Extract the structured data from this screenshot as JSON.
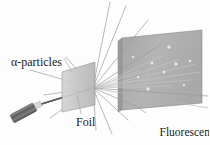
{
  "figure": {
    "background_color": "#fdfdfd"
  },
  "labels": {
    "alpha_particles": "α-particles",
    "foil": "Foil",
    "screen_line1": "Fluorescent",
    "screen_line2": "screen"
  },
  "colors": {
    "foil_fill": "#c8c8c8",
    "foil_edge": "#8f8f8f",
    "screen_fill": "#b0b0b0",
    "screen_edge": "#8a8a8a",
    "screen_side_fill": "#9a9a9a",
    "source_body": "#6e6e6e",
    "source_tip": "#d8d8d8",
    "ray": "#9b9b9b",
    "beam": "#4a4a4a",
    "flash": "#f2f2f2",
    "label_text": "#1a1a1a",
    "leader": "#a8a8a8"
  },
  "geometry": {
    "scatter_point": {
      "x": 93,
      "y": 88
    },
    "foil_quad": "62,72 95,62 95,105 62,112",
    "screen_quad": "122,38 202,30 202,103 122,110",
    "screen_side_quad": "118,41 122,38 122,110 118,112",
    "source": {
      "x1": 12,
      "y1": 119,
      "x2": 40,
      "y2": 104,
      "width": 9
    }
  },
  "rays": [
    {
      "name": "incident-beam",
      "x1": 38,
      "y1": 105,
      "x2": 93,
      "y2": 88,
      "w": 1.4,
      "color": "#4a4a4a"
    },
    {
      "name": "incident-beam-2",
      "x1": 30,
      "y1": 108,
      "x2": 93,
      "y2": 88,
      "w": 1.0,
      "color": "#5a5a5a"
    },
    {
      "name": "backscatter-left-1",
      "x1": 93,
      "y1": 88,
      "x2": 30,
      "y2": 70,
      "w": 0.7,
      "color": "#9b9b9b"
    },
    {
      "name": "backscatter-left-2",
      "x1": 93,
      "y1": 88,
      "x2": 44,
      "y2": 95,
      "w": 0.7,
      "color": "#9b9b9b"
    },
    {
      "name": "backscatter-left-3",
      "x1": 93,
      "y1": 88,
      "x2": 50,
      "y2": 118,
      "w": 0.7,
      "color": "#9b9b9b"
    },
    {
      "name": "backscatter-left-4",
      "x1": 93,
      "y1": 88,
      "x2": 66,
      "y2": 57,
      "w": 0.7,
      "color": "#9b9b9b"
    },
    {
      "name": "scatter-up-1",
      "x1": 93,
      "y1": 88,
      "x2": 110,
      "y2": 2,
      "w": 0.7,
      "color": "#9b9b9b"
    },
    {
      "name": "scatter-up-2",
      "x1": 93,
      "y1": 88,
      "x2": 126,
      "y2": 6,
      "w": 0.7,
      "color": "#9b9b9b"
    },
    {
      "name": "scatter-up-3",
      "x1": 93,
      "y1": 88,
      "x2": 148,
      "y2": 20,
      "w": 0.7,
      "color": "#9b9b9b"
    },
    {
      "name": "scatter-up-4",
      "x1": 93,
      "y1": 88,
      "x2": 160,
      "y2": 45,
      "w": 0.7,
      "color": "#9b9b9b"
    },
    {
      "name": "scatter-screen-1",
      "x1": 93,
      "y1": 88,
      "x2": 162,
      "y2": 56,
      "w": 0.7,
      "color": "#c4c4c4"
    },
    {
      "name": "scatter-screen-2",
      "x1": 93,
      "y1": 88,
      "x2": 178,
      "y2": 60,
      "w": 0.7,
      "color": "#c4c4c4"
    },
    {
      "name": "scatter-screen-3",
      "x1": 93,
      "y1": 88,
      "x2": 196,
      "y2": 64,
      "w": 0.7,
      "color": "#c4c4c4"
    },
    {
      "name": "scatter-screen-4",
      "x1": 93,
      "y1": 88,
      "x2": 200,
      "y2": 72,
      "w": 0.7,
      "color": "#c4c4c4"
    },
    {
      "name": "scatter-screen-5",
      "x1": 93,
      "y1": 88,
      "x2": 190,
      "y2": 80,
      "w": 0.7,
      "color": "#c4c4c4"
    },
    {
      "name": "scatter-screen-6",
      "x1": 93,
      "y1": 88,
      "x2": 170,
      "y2": 86,
      "w": 0.7,
      "color": "#c4c4c4"
    },
    {
      "name": "scatter-screen-7",
      "x1": 93,
      "y1": 88,
      "x2": 150,
      "y2": 78,
      "w": 0.7,
      "color": "#c4c4c4"
    },
    {
      "name": "scatter-screen-8",
      "x1": 93,
      "y1": 88,
      "x2": 140,
      "y2": 70,
      "w": 0.7,
      "color": "#c4c4c4"
    },
    {
      "name": "scatter-down-1",
      "x1": 93,
      "y1": 88,
      "x2": 140,
      "y2": 108,
      "w": 0.7,
      "color": "#9b9b9b"
    },
    {
      "name": "scatter-down-2",
      "x1": 93,
      "y1": 88,
      "x2": 128,
      "y2": 120,
      "w": 0.7,
      "color": "#9b9b9b"
    },
    {
      "name": "scatter-down-3",
      "x1": 93,
      "y1": 88,
      "x2": 112,
      "y2": 134,
      "w": 0.7,
      "color": "#9b9b9b"
    },
    {
      "name": "scatter-down-4",
      "x1": 93,
      "y1": 88,
      "x2": 96,
      "y2": 130,
      "w": 0.7,
      "color": "#9b9b9b"
    },
    {
      "name": "scatter-far-right-low",
      "x1": 93,
      "y1": 88,
      "x2": 208,
      "y2": 96,
      "w": 0.7,
      "color": "#9b9b9b"
    },
    {
      "name": "scatter-far-right-edge",
      "x1": 93,
      "y1": 88,
      "x2": 208,
      "y2": 108,
      "w": 0.7,
      "color": "#b5b5b5"
    }
  ],
  "flashes": [
    {
      "name": "flash-1",
      "x": 169,
      "y": 47,
      "r": 2.2
    },
    {
      "name": "flash-2",
      "x": 152,
      "y": 63,
      "r": 2.0
    },
    {
      "name": "flash-3",
      "x": 176,
      "y": 64,
      "r": 2.2
    },
    {
      "name": "flash-4",
      "x": 190,
      "y": 61,
      "r": 1.8
    },
    {
      "name": "flash-5",
      "x": 164,
      "y": 72,
      "r": 2.0
    },
    {
      "name": "flash-6",
      "x": 138,
      "y": 77,
      "r": 1.8
    },
    {
      "name": "flash-7",
      "x": 148,
      "y": 89,
      "r": 2.2
    },
    {
      "name": "flash-8",
      "x": 184,
      "y": 85,
      "r": 1.8
    },
    {
      "name": "flash-9",
      "x": 133,
      "y": 57,
      "r": 1.6
    }
  ],
  "leaders": [
    {
      "name": "leader-alpha",
      "x1": 64,
      "y1": 58,
      "x2": 72,
      "y2": 72
    },
    {
      "name": "leader-foil",
      "x1": 81,
      "y1": 114,
      "x2": 77,
      "y2": 95
    },
    {
      "name": "leader-screen",
      "x1": 146,
      "y1": 113,
      "x2": 133,
      "y2": 104
    }
  ]
}
